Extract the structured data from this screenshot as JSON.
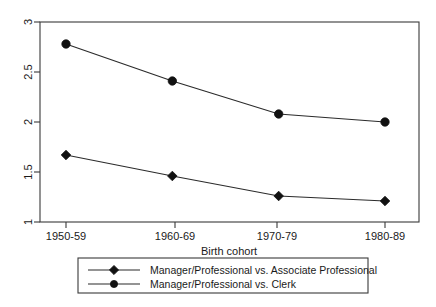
{
  "chart_data": {
    "type": "line",
    "title": "",
    "subtitle": "",
    "xlabel": "Birth cohort",
    "ylabel": "",
    "categories": [
      "1950-59",
      "1960-69",
      "1970-79",
      "1980-89"
    ],
    "xtick_labels": [
      "1950-59",
      "1960-69",
      "1970-79",
      "1980-89"
    ],
    "ytick_labels": [
      "1",
      "1.5",
      "2",
      "2.5",
      "3"
    ],
    "ylim": [
      1,
      3
    ],
    "ytick_values": [
      1,
      1.5,
      2,
      2.5,
      3
    ],
    "grid": false,
    "legend_position": "below-axes",
    "series": [
      {
        "name": "Manager/Professional vs. Associate Professional",
        "marker": "diamond",
        "color": "#111111",
        "values": [
          1.67,
          1.46,
          1.26,
          1.21
        ]
      },
      {
        "name": "Manager/Professional vs. Clerk",
        "marker": "circle",
        "color": "#111111",
        "values": [
          2.78,
          2.41,
          2.08,
          2.0
        ]
      }
    ]
  },
  "axes": {
    "x_title": "Birth cohort",
    "y_title": ""
  },
  "legend": {
    "entries": [
      {
        "label": "Manager/Professional vs. Associate Professional",
        "marker": "diamond-marker-icon"
      },
      {
        "label": "Manager/Professional vs. Clerk",
        "marker": "circle-marker-icon"
      }
    ]
  },
  "ticks": {
    "y": [
      "3",
      "2.5",
      "2",
      "1.5",
      "1"
    ],
    "x": [
      "1950-59",
      "1960-69",
      "1970-79",
      "1980-89"
    ]
  }
}
